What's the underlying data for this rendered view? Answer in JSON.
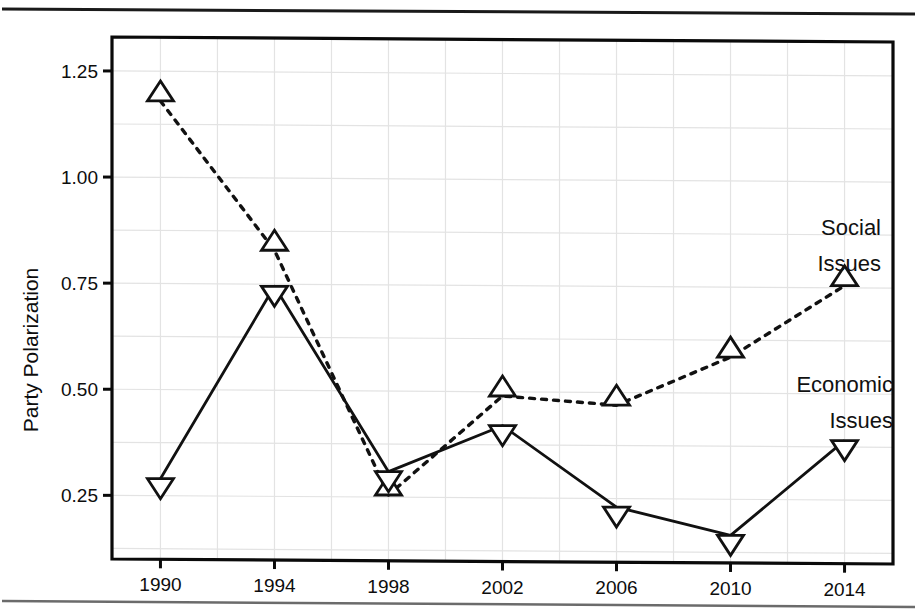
{
  "chart_data": {
    "type": "line",
    "title": "",
    "xlabel": "",
    "ylabel": "Party Polarization",
    "x": [
      1990,
      1994,
      1998,
      2002,
      2006,
      2010,
      2014
    ],
    "xtick_labels": [
      "1990",
      "1994",
      "1998",
      "2002",
      "2006",
      "2010",
      "2014"
    ],
    "ytick_labels": [
      "0.25",
      "0.50",
      "0.75",
      "1.00",
      "1.25"
    ],
    "ytick_values": [
      0.25,
      0.5,
      0.75,
      1.0,
      1.25
    ],
    "ylim": [
      0.1,
      1.33
    ],
    "xlim": [
      1988.3,
      2015.7
    ],
    "grid": true,
    "legend_position": "inline-annotations",
    "series": [
      {
        "name": "Social Issues",
        "marker": "triangle-up",
        "linestyle": "dashed",
        "color": "#111111",
        "values": [
          1.18,
          0.83,
          0.255,
          0.49,
          0.47,
          0.585,
          0.755
        ],
        "annotation": {
          "line1": "Social",
          "line2": "Issues"
        }
      },
      {
        "name": "Economic Issues",
        "marker": "triangle-down",
        "linestyle": "solid",
        "color": "#111111",
        "values": [
          0.29,
          0.745,
          0.31,
          0.42,
          0.23,
          0.165,
          0.39
        ],
        "annotation": {
          "line1": "Economic",
          "line2": "Issues"
        }
      }
    ]
  },
  "colors": {
    "ink": "#111111",
    "grid": "#e3e3e3",
    "frame": "#0a0a0a",
    "background": "#ffffff"
  }
}
